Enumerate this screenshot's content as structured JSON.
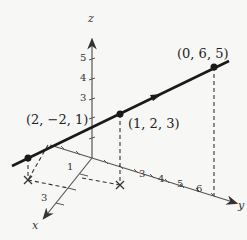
{
  "diagram": {
    "type": "3d-line-in-space",
    "axes": {
      "x": {
        "label": "x",
        "ticks": [
          "1",
          "3"
        ]
      },
      "y": {
        "label": "y",
        "ticks": [
          "3",
          "4",
          "5",
          "6"
        ]
      },
      "z": {
        "label": "z",
        "ticks": [
          "3",
          "4",
          "5"
        ]
      }
    },
    "points": [
      {
        "label": "(2, −2, 1)",
        "coords": [
          2,
          -2,
          1
        ]
      },
      {
        "label": "(1, 2, 3)",
        "coords": [
          1,
          2,
          3
        ]
      },
      {
        "label": "(0, 6, 5)",
        "coords": [
          0,
          6,
          5
        ]
      }
    ],
    "line_color": "#1a1a1a",
    "axis_color": "#555555"
  }
}
